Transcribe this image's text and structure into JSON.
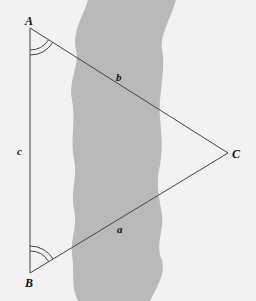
{
  "diagram": {
    "type": "triangle-across-river",
    "colors": {
      "background": "#f2f2f2",
      "river": "#b9b9b9",
      "line": "#444444",
      "text": "#111111"
    },
    "vertices": [
      {
        "id": "A",
        "label": "A",
        "x": 30,
        "y": 28
      },
      {
        "id": "B",
        "label": "B",
        "x": 30,
        "y": 273
      },
      {
        "id": "C",
        "label": "C",
        "x": 228,
        "y": 153
      }
    ],
    "sides": [
      {
        "id": "a",
        "label": "a",
        "from": "B",
        "to": "C"
      },
      {
        "id": "b",
        "label": "b",
        "from": "A",
        "to": "C"
      },
      {
        "id": "c",
        "label": "c",
        "from": "A",
        "to": "B"
      }
    ],
    "angle_marks": [
      {
        "vertex": "A",
        "arcs": 2
      },
      {
        "vertex": "B",
        "arcs": 2
      }
    ]
  }
}
